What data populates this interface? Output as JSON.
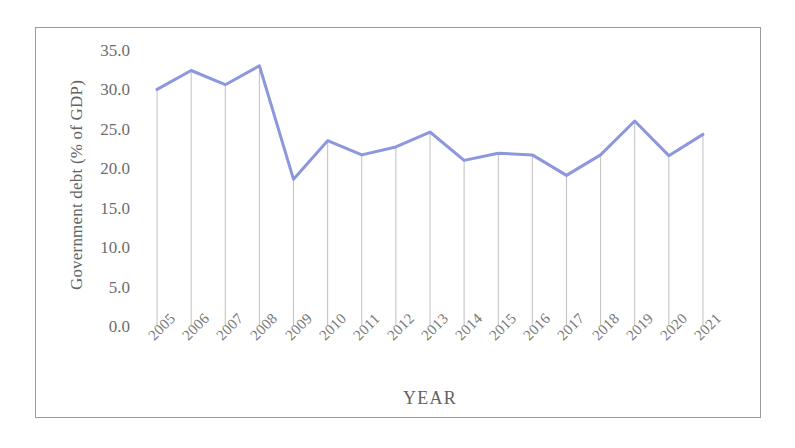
{
  "chart_data": {
    "type": "line",
    "title": "",
    "xlabel": "YEAR",
    "ylabel": "Government debt (% of GDP)",
    "categories": [
      "2005",
      "2006",
      "2007",
      "2008",
      "2009",
      "2010",
      "2011",
      "2012",
      "2013",
      "2014",
      "2015",
      "2016",
      "2017",
      "2018",
      "2019",
      "2020",
      "2021"
    ],
    "values": [
      30.0,
      32.4,
      30.6,
      33.0,
      18.6,
      23.5,
      21.7,
      22.7,
      24.6,
      21.0,
      21.9,
      21.7,
      19.1,
      21.7,
      26.0,
      21.6,
      24.3
    ],
    "series": [
      {
        "name": "Government debt (% of GDP)",
        "color": "#8d97dd",
        "values": [
          30.0,
          32.4,
          30.6,
          33.0,
          18.6,
          23.5,
          21.7,
          22.7,
          24.6,
          21.0,
          21.9,
          21.7,
          19.1,
          21.7,
          26.0,
          21.6,
          24.3
        ]
      }
    ],
    "ylim": [
      0.0,
      35.0
    ],
    "ytick_step": 5.0,
    "ytick_labels": [
      "35.0",
      "30.0",
      "25.0",
      "20.0",
      "15.0",
      "10.0",
      "5.0",
      "0.0"
    ],
    "ytick_values": [
      35.0,
      30.0,
      25.0,
      20.0,
      15.0,
      10.0,
      5.0,
      0.0
    ],
    "grid": "vertical-droplines-only",
    "legend": "none",
    "xtick_rotation_deg": -45,
    "colors": {
      "line": "#8d97dd",
      "gridline": "#b9b9b9",
      "text": "#6d6d6d",
      "frame": "#9a9a9a",
      "background": "#ffffff"
    },
    "line_width_px": 3
  }
}
